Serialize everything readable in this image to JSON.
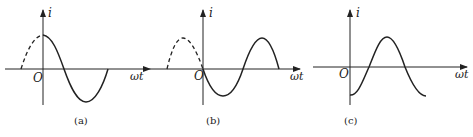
{
  "panels": [
    {
      "caption": "(a)",
      "y_axis_label": "i",
      "x_axis_label": "ωt",
      "origin_label": "O",
      "description": "Cosine-like waveform: starts at positive peak at t=0, dashed portion before origin"
    },
    {
      "caption": "(b)",
      "y_axis_label": "i",
      "x_axis_label": "ωt",
      "origin_label": "O",
      "description": "Negative sine waveform: starts at zero going negative at t=0, dashed positive half before origin"
    },
    {
      "caption": "(c)",
      "y_axis_label": "i",
      "x_axis_label": "ωt",
      "origin_label": "O",
      "description": "Negative cosine waveform: starts at negative peak at t=0"
    }
  ],
  "colors": {
    "line": "#222222",
    "background": "#ffffff"
  }
}
